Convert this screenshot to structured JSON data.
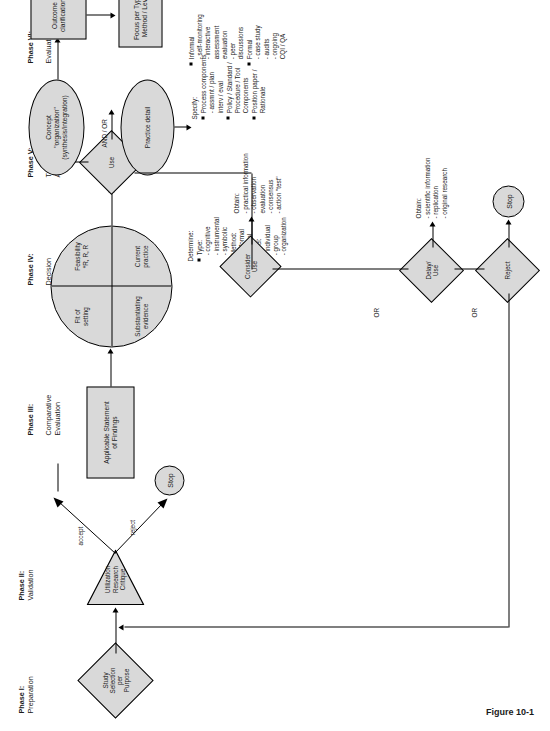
{
  "figure": {
    "caption": "Figure 10-1"
  },
  "phases": [
    {
      "id": "phase-1",
      "title": "Phase I:",
      "subtitle": "Preparation"
    },
    {
      "id": "phase-2",
      "title": "Phase II:",
      "subtitle": "Validation"
    },
    {
      "id": "phase-3",
      "title": "Phase III:",
      "subtitle": "Comparative\nEvaluation"
    },
    {
      "id": "phase-4",
      "title": "Phase IV:",
      "subtitle": "Decision\nMaking"
    },
    {
      "id": "phase-5",
      "title": "Phase V:",
      "subtitle": "Translation/\nApplication"
    },
    {
      "id": "phase-6",
      "title": "Phase VI:",
      "subtitle": "Evaluation"
    }
  ],
  "nodes": {
    "study_selection": "Study\nSelection\nper\nPurpose",
    "utilization_critique": "Utilization\nResearch\nCritique",
    "stop_validation": "Stop",
    "applicable_statement": "Applicable Statement\nof Findings",
    "use_diamond": "Use",
    "consider_use_diamond": "Consider\nUse",
    "delay_use_diamond": "Delay/\nUse",
    "reject_diamond": "Reject",
    "stop_reject": "Stop",
    "concept_ellipse": "Concept\n\"organization\"\n(synthesis/integration)",
    "practice_detail_ellipse": "Practice detail",
    "outcome_clarification": "Outcome\nclarification",
    "focus_per": "Focus per Type /\nMethod / Level"
  },
  "quadrants": {
    "feasibility": "Feasibility\n*R, R, R",
    "current_practice": "Current\npractice",
    "fit_of_setting": "Fit of\nsetting",
    "substantiating_evidence": "Substantiating\nevidence"
  },
  "edge_labels": {
    "accept": "accept",
    "reject": "reject",
    "and_or": "AND / OR",
    "or_1": "OR",
    "or_2": "OR"
  },
  "lists": {
    "determine": {
      "header": "Determine:",
      "items": [
        {
          "label": "Type:",
          "subs": "- cognitive\n- instrumental\n- symbolic"
        },
        {
          "label": "Method:",
          "subs": "- informal\n- formal"
        },
        {
          "label": "Level:",
          "subs": "- individual\n- group\n- organization"
        }
      ]
    },
    "obtain_practical": {
      "header": "Obtain:",
      "subs": "- practical information\n- observation\n  evaluation\n- consensus\n- action \"test\""
    },
    "obtain_scientific": {
      "header": "Obtain:",
      "subs": "- scientific information\n- replication\n- original research"
    },
    "specify": {
      "header": "Specify:",
      "items": [
        {
          "label": "Process components",
          "subs": "- assmnt / plan\n  interv / eval"
        },
        {
          "label": "Policy / Standard /\nProcedure / Tool\nComponents",
          "subs": ""
        },
        {
          "label": "Position paper /\nRationale",
          "subs": ""
        }
      ]
    },
    "evaluation_methods": {
      "items": [
        {
          "label": "Informal",
          "subs": "- self-monitoring\n- interactive\n  assessment\n  evaluation\n- peer\n  discussions"
        },
        {
          "label": "Formal",
          "subs": "- case study\n- audits\n- ongoing\n  CQI / QA"
        }
      ]
    }
  }
}
